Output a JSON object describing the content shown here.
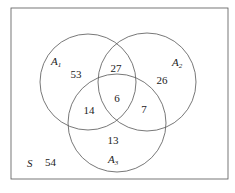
{
  "diagram": {
    "type": "venn",
    "universe_label": "S",
    "universe_outside_count": "54",
    "sets": [
      {
        "name": "A",
        "subscript": "1"
      },
      {
        "name": "A",
        "subscript": "2"
      },
      {
        "name": "A",
        "subscript": "3"
      }
    ],
    "regions": {
      "a1_only": "53",
      "a2_only": "26",
      "a3_only": "13",
      "a1_a2_only": "27",
      "a1_a3_only": "14",
      "a2_a3_only": "7",
      "a1_a2_a3": "6",
      "outside": "54"
    },
    "colors": {
      "stroke": "#555555",
      "text": "#222222",
      "background": "#ffffff"
    }
  }
}
